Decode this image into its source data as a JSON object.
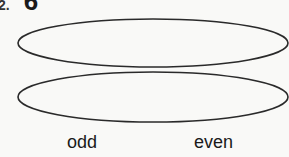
{
  "heading": {
    "number": "2.",
    "glyph": "6"
  },
  "ovals": [
    {
      "name": "top-oval",
      "cx": 153,
      "cy": 43,
      "rx": 135,
      "ry": 24
    },
    {
      "name": "bottom-oval",
      "cx": 153,
      "cy": 97,
      "rx": 135,
      "ry": 25
    }
  ],
  "labels": {
    "odd": "odd",
    "even": "even"
  },
  "colors": {
    "stroke": "#2a2a2a",
    "background": "#f9f9f7"
  }
}
